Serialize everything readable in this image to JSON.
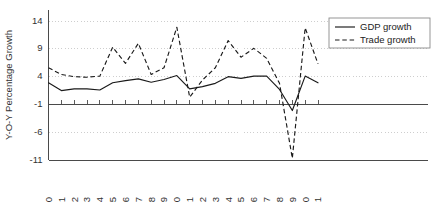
{
  "chart_data": {
    "type": "line",
    "title": "",
    "xlabel": "",
    "ylabel": "Y-O-Y Percentage Growth",
    "x": [
      1990,
      1991,
      1992,
      1993,
      1994,
      1995,
      1996,
      1997,
      1998,
      1999,
      2000,
      2001,
      2002,
      2003,
      2004,
      2005,
      2006,
      2007,
      2008,
      2009,
      2010,
      2011
    ],
    "xtick_labels": [
      "1990",
      "1991",
      "1992",
      "1993",
      "1994",
      "1995",
      "1996",
      "1997",
      "1998",
      "1999",
      "2000",
      "2001",
      "2002",
      "2003",
      "2004",
      "2005",
      "2006",
      "2007",
      "2008",
      "2009",
      "2010",
      "2011"
    ],
    "ytick_labels": [
      "14",
      "9",
      "4",
      "-1",
      "-6",
      "-11"
    ],
    "yticks": [
      14,
      9,
      4,
      -1,
      -6,
      -11
    ],
    "ylim": [
      -11,
      16
    ],
    "xlim": [
      1990,
      2011
    ],
    "grid": true,
    "grid_axis": "y",
    "legend_position": "top-right",
    "series": [
      {
        "name": "GDP growth",
        "style": "solid",
        "color": "#1a1a1a",
        "values": [
          2.9,
          1.5,
          1.8,
          1.8,
          1.6,
          2.9,
          3.3,
          3.6,
          3.0,
          3.5,
          4.2,
          1.8,
          2.2,
          2.8,
          4.0,
          3.7,
          4.1,
          4.1,
          1.7,
          -2.1,
          4.1,
          2.9
        ]
      },
      {
        "name": "Trade growth",
        "style": "dashed",
        "color": "#1a1a1a",
        "values": [
          5.6,
          4.4,
          4.0,
          3.9,
          4.1,
          9.3,
          6.4,
          10.0,
          4.4,
          5.6,
          12.9,
          0.3,
          3.4,
          5.6,
          10.5,
          7.5,
          9.1,
          7.3,
          2.8,
          -10.7,
          12.8,
          6.3
        ]
      }
    ]
  },
  "legend": {
    "items": [
      {
        "label": "GDP growth",
        "style": "solid"
      },
      {
        "label": "Trade growth",
        "style": "dashed"
      }
    ]
  }
}
